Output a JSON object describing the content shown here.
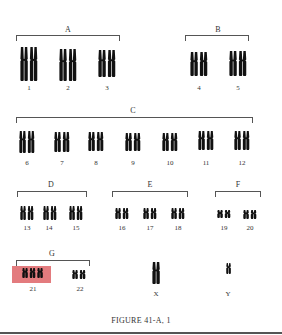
{
  "figure": {
    "caption": "FIGURE 41-A, 1",
    "highlight_color": "#e37b7e",
    "chromosome_color": "#111111"
  },
  "groups": [
    {
      "label": "A",
      "chromosomes": [
        "1",
        "2",
        "3"
      ]
    },
    {
      "label": "B",
      "chromosomes": [
        "4",
        "5"
      ]
    },
    {
      "label": "C",
      "chromosomes": [
        "6",
        "7",
        "8",
        "9",
        "10",
        "11",
        "12"
      ]
    },
    {
      "label": "D",
      "chromosomes": [
        "13",
        "14",
        "15"
      ]
    },
    {
      "label": "E",
      "chromosomes": [
        "16",
        "17",
        "18"
      ]
    },
    {
      "label": "F",
      "chromosomes": [
        "19",
        "20"
      ]
    },
    {
      "label": "G",
      "chromosomes": [
        "21",
        "22"
      ]
    }
  ],
  "sex_chromosomes": [
    "X",
    "Y"
  ],
  "highlighted": {
    "chromosome": "21",
    "copies": 3,
    "note": "trisomy 21"
  }
}
